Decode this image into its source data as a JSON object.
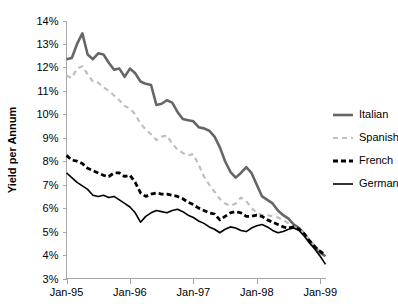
{
  "chart_data": {
    "type": "line",
    "title": "",
    "subtitle": "",
    "xlabel": "",
    "ylabel": "Yield per Annum",
    "ylim": [
      3,
      14
    ],
    "ytick_values": [
      3,
      4,
      5,
      6,
      7,
      8,
      9,
      10,
      11,
      12,
      13,
      14
    ],
    "ytick_labels": [
      "3%",
      "4%",
      "5%",
      "6%",
      "7%",
      "8%",
      "9%",
      "10%",
      "11%",
      "12%",
      "13%",
      "14%"
    ],
    "xtick_labels": [
      "Jan-95",
      "Jan-96",
      "Jan-97",
      "Jan-98",
      "Jan-99"
    ],
    "xtick_positions": [
      0,
      12,
      24,
      36,
      48
    ],
    "xlim": [
      0,
      49
    ],
    "grid": false,
    "legend_position": "right",
    "x": [
      0,
      1,
      2,
      3,
      4,
      5,
      6,
      7,
      8,
      9,
      10,
      11,
      12,
      13,
      14,
      15,
      16,
      17,
      18,
      19,
      20,
      21,
      22,
      23,
      24,
      25,
      26,
      27,
      28,
      29,
      30,
      31,
      32,
      33,
      34,
      35,
      36,
      37,
      38,
      39,
      40,
      41,
      42,
      43,
      44,
      45,
      46,
      47,
      48,
      49
    ],
    "series": [
      {
        "name": "Italian",
        "color": "#666666",
        "style": "solid",
        "width": 2.6,
        "values": [
          12.35,
          12.4,
          13.0,
          13.45,
          12.55,
          12.35,
          12.6,
          12.55,
          12.2,
          11.9,
          11.95,
          11.6,
          11.95,
          11.75,
          11.4,
          11.3,
          11.25,
          10.4,
          10.45,
          10.6,
          10.5,
          10.1,
          9.8,
          9.75,
          9.7,
          9.45,
          9.4,
          9.3,
          9.05,
          8.6,
          8.0,
          7.55,
          7.3,
          7.5,
          7.75,
          7.5,
          7.0,
          6.5,
          6.35,
          6.2,
          5.9,
          5.7,
          5.55,
          5.3,
          5.15,
          4.9,
          4.6,
          4.35,
          4.1,
          3.95
        ]
      },
      {
        "name": "Spanish",
        "color": "#bfbfbf",
        "style": "dashed",
        "width": 2.2,
        "values": [
          11.65,
          11.55,
          11.95,
          12.05,
          11.7,
          11.4,
          11.35,
          11.15,
          11.0,
          10.8,
          10.6,
          10.35,
          10.25,
          10.0,
          9.6,
          9.35,
          9.15,
          8.9,
          9.05,
          9.1,
          8.75,
          8.5,
          8.35,
          8.25,
          8.3,
          7.85,
          7.35,
          7.0,
          6.7,
          6.4,
          6.2,
          6.1,
          6.2,
          6.45,
          6.3,
          6.0,
          5.8,
          5.7,
          5.7,
          5.65,
          5.6,
          5.5,
          5.35,
          5.2,
          5.1,
          4.9,
          4.6,
          4.4,
          4.15,
          4.0
        ]
      },
      {
        "name": "French",
        "color": "#000000",
        "style": "dashed",
        "width": 2.8,
        "values": [
          8.25,
          8.05,
          8.0,
          7.9,
          7.7,
          7.6,
          7.5,
          7.4,
          7.35,
          7.5,
          7.5,
          7.35,
          7.4,
          7.1,
          6.65,
          6.5,
          6.6,
          6.65,
          6.6,
          6.6,
          6.55,
          6.5,
          6.4,
          6.25,
          6.15,
          6.0,
          5.9,
          5.8,
          5.75,
          5.5,
          5.65,
          5.8,
          5.85,
          5.8,
          5.65,
          5.65,
          5.7,
          5.65,
          5.5,
          5.4,
          5.3,
          5.2,
          5.15,
          5.2,
          5.1,
          4.9,
          4.6,
          4.35,
          4.15,
          4.0
        ]
      },
      {
        "name": "German",
        "color": "#000000",
        "style": "solid",
        "width": 1.6,
        "values": [
          7.5,
          7.3,
          7.1,
          6.95,
          6.8,
          6.55,
          6.5,
          6.55,
          6.45,
          6.5,
          6.35,
          6.2,
          6.05,
          5.8,
          5.4,
          5.65,
          5.8,
          5.9,
          5.85,
          5.8,
          5.9,
          5.95,
          5.85,
          5.7,
          5.6,
          5.45,
          5.35,
          5.2,
          5.1,
          4.95,
          5.1,
          5.2,
          5.15,
          5.05,
          5.0,
          5.15,
          5.25,
          5.3,
          5.2,
          5.05,
          4.95,
          5.0,
          5.1,
          5.15,
          5.05,
          4.8,
          4.5,
          4.25,
          3.95,
          3.6
        ]
      }
    ],
    "legend_entries": [
      {
        "label": "Italian"
      },
      {
        "label": "Spanish"
      },
      {
        "label": "French"
      },
      {
        "label": "German"
      }
    ]
  }
}
